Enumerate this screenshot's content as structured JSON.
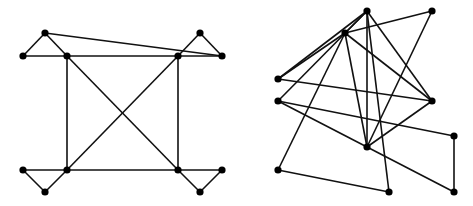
{
  "colors": {
    "edge": "#111111",
    "node": "#000000",
    "background": "#ffffff"
  },
  "node_radius": 3.6,
  "graphs": [
    {
      "name": "left-graph",
      "nodes": [
        {
          "id": "L1",
          "x": 23,
          "y": 56
        },
        {
          "id": "L2",
          "x": 45,
          "y": 33
        },
        {
          "id": "L3",
          "x": 67,
          "y": 56
        },
        {
          "id": "L4",
          "x": 178,
          "y": 56
        },
        {
          "id": "L5",
          "x": 200,
          "y": 33
        },
        {
          "id": "L6",
          "x": 222,
          "y": 56
        },
        {
          "id": "L7",
          "x": 23,
          "y": 170
        },
        {
          "id": "L8",
          "x": 45,
          "y": 192
        },
        {
          "id": "L9",
          "x": 67,
          "y": 170
        },
        {
          "id": "L10",
          "x": 178,
          "y": 170
        },
        {
          "id": "L11",
          "x": 200,
          "y": 192
        },
        {
          "id": "L12",
          "x": 222,
          "y": 170
        }
      ],
      "edges": [
        [
          "L1",
          "L2"
        ],
        [
          "L2",
          "L3"
        ],
        [
          "L1",
          "L6"
        ],
        [
          "L2",
          "L6"
        ],
        [
          "L4",
          "L5"
        ],
        [
          "L5",
          "L6"
        ],
        [
          "L3",
          "L9"
        ],
        [
          "L4",
          "L10"
        ],
        [
          "L3",
          "L10"
        ],
        [
          "L4",
          "L9"
        ],
        [
          "L7",
          "L12"
        ],
        [
          "L7",
          "L8"
        ],
        [
          "L8",
          "L9"
        ],
        [
          "L10",
          "L11"
        ],
        [
          "L11",
          "L12"
        ]
      ]
    },
    {
      "name": "right-graph",
      "nodes": [
        {
          "id": "A",
          "x": 367,
          "y": 11
        },
        {
          "id": "B",
          "x": 432,
          "y": 11
        },
        {
          "id": "C",
          "x": 345,
          "y": 33
        },
        {
          "id": "D",
          "x": 278,
          "y": 79
        },
        {
          "id": "E",
          "x": 278,
          "y": 101
        },
        {
          "id": "F",
          "x": 432,
          "y": 101
        },
        {
          "id": "G",
          "x": 367,
          "y": 147
        },
        {
          "id": "H",
          "x": 454,
          "y": 136
        },
        {
          "id": "I",
          "x": 278,
          "y": 170
        },
        {
          "id": "J",
          "x": 389,
          "y": 192
        },
        {
          "id": "K",
          "x": 454,
          "y": 192
        }
      ],
      "edges": [
        [
          "A",
          "C"
        ],
        [
          "A",
          "D"
        ],
        [
          "A",
          "E"
        ],
        [
          "A",
          "G"
        ],
        [
          "A",
          "J"
        ],
        [
          "A",
          "F"
        ],
        [
          "B",
          "C"
        ],
        [
          "B",
          "G"
        ],
        [
          "C",
          "D"
        ],
        [
          "C",
          "I"
        ],
        [
          "C",
          "G"
        ],
        [
          "C",
          "F"
        ],
        [
          "D",
          "F"
        ],
        [
          "E",
          "H"
        ],
        [
          "E",
          "G"
        ],
        [
          "F",
          "G"
        ],
        [
          "G",
          "K"
        ],
        [
          "H",
          "K"
        ],
        [
          "I",
          "J"
        ]
      ]
    }
  ]
}
